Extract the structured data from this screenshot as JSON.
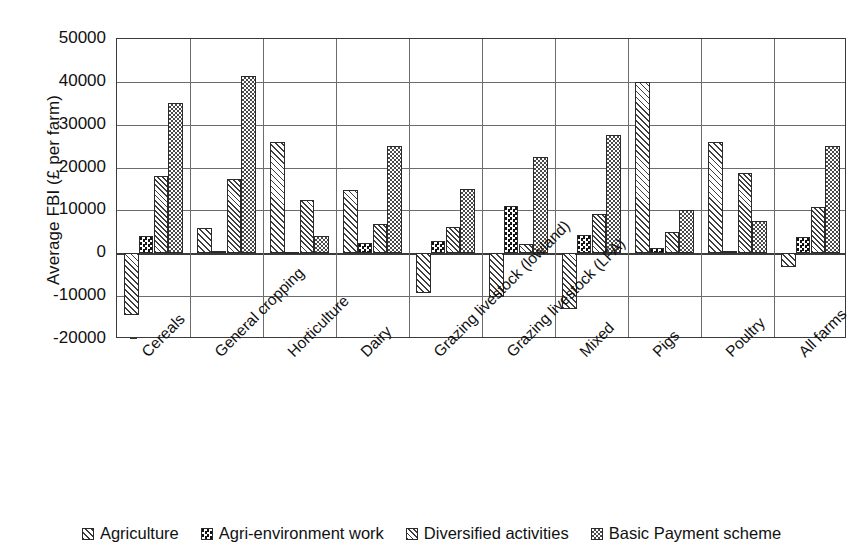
{
  "chart_data": {
    "type": "bar",
    "title": "",
    "xlabel": "",
    "ylabel": "Average FBI (£ per farm)",
    "ylim": [
      -20000,
      50000
    ],
    "ytick_labels": [
      "50000",
      "40000",
      "30000",
      "20000",
      "10000",
      "0",
      "-10000",
      "-20000"
    ],
    "ytick_values": [
      50000,
      40000,
      30000,
      20000,
      10000,
      0,
      -10000,
      -20000
    ],
    "grid": true,
    "legend_position": "bottom",
    "categories": [
      "Cereals",
      "General cropping",
      "Horticulture",
      "Dairy",
      "Grazing livestock (lowland)",
      "Grazing livestock (LFA)",
      "Mixed",
      "Pigs",
      "Poultry",
      "All farms"
    ],
    "series": [
      {
        "name": "Agriculture",
        "pattern": "diagonal-hatch",
        "values": [
          -14500,
          5800,
          26000,
          14800,
          -9200,
          -10200,
          -13000,
          40000,
          26000,
          -3200
        ]
      },
      {
        "name": "Agri-environment work",
        "pattern": "dark-checker",
        "values": [
          4000,
          500,
          200,
          2500,
          2800,
          11000,
          4200,
          1200,
          500,
          3800
        ]
      },
      {
        "name": "Diversified activities",
        "pattern": "dense-diagonal-hatch",
        "values": [
          18000,
          17300,
          12400,
          6800,
          6100,
          2200,
          9200,
          5000,
          18800,
          10800
        ]
      },
      {
        "name": "Basic Payment scheme",
        "pattern": "fine-checker",
        "values": [
          35000,
          41300,
          4100,
          25000,
          15000,
          22500,
          27500,
          10200,
          7500,
          25000
        ]
      }
    ]
  },
  "legend": {
    "items": [
      {
        "label": "Agriculture",
        "pattern": "diagonal-hatch"
      },
      {
        "label": "Agri-environment work",
        "pattern": "dark-checker"
      },
      {
        "label": "Diversified activities",
        "pattern": "dense-diagonal-hatch"
      },
      {
        "label": "Basic Payment scheme",
        "pattern": "fine-checker"
      }
    ]
  },
  "colors": {
    "axis": "#3a3a3a",
    "grid": "#6c6c6c",
    "text": "#111111",
    "background": "#ffffff"
  }
}
